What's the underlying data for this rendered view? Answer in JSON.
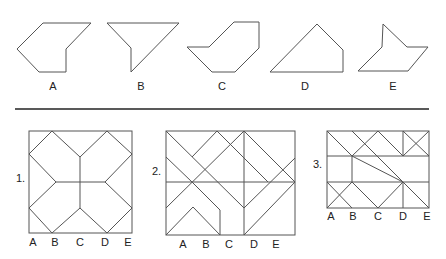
{
  "options": [
    {
      "label": "A",
      "x": 53,
      "points": "43,23 91,23 66,49 66,72 39,72 17,49"
    },
    {
      "label": "B",
      "x": 141,
      "points": "107,23 179,23 131,72 131,48"
    },
    {
      "label": "C",
      "x": 222,
      "points": "187,47 209,47 234,22 259,22 259,48 235,72 212,72"
    },
    {
      "label": "D",
      "x": 305,
      "points": "270,72 317,24 343,50 343,72"
    },
    {
      "label": "E",
      "x": 393,
      "points": "383,24 407,47 428,47 408,71 358,71 382,47"
    }
  ],
  "figures": [
    {
      "number": "1.",
      "num_x": 16,
      "num_y": 175,
      "columns": [
        "A",
        "B",
        "C",
        "D",
        "E"
      ],
      "col_x": [
        33,
        55,
        80,
        105,
        128
      ],
      "col_y": 238
    },
    {
      "number": "2.",
      "num_x": 152,
      "num_y": 170,
      "columns": [
        "A",
        "B",
        "C",
        "D",
        "E"
      ],
      "col_x": [
        183,
        206,
        229,
        254,
        276
      ],
      "col_y": 240
    },
    {
      "number": "3.",
      "num_x": 313,
      "num_y": 163,
      "columns": [
        "A",
        "B",
        "C",
        "D",
        "E"
      ],
      "col_x": [
        331,
        352,
        378,
        403,
        426
      ],
      "col_y": 211
    }
  ]
}
